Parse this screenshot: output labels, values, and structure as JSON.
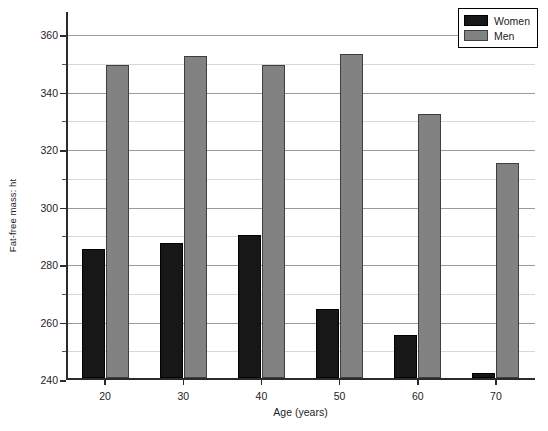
{
  "chart_data": {
    "type": "bar",
    "title": "",
    "xlabel": "Age (years)",
    "ylabel": "Fat-free mass: ht",
    "categories": [
      "20",
      "30",
      "40",
      "50",
      "60",
      "70"
    ],
    "series": [
      {
        "name": "Women",
        "color": "#171717",
        "values": [
          285,
          287,
          290,
          264,
          255,
          242
        ]
      },
      {
        "name": "Men",
        "color": "#828282",
        "values": [
          349,
          352,
          349,
          353,
          332,
          315
        ]
      }
    ],
    "ylim": [
      240,
      368
    ],
    "y_ticks": [
      240,
      260,
      280,
      300,
      320,
      340,
      360
    ],
    "y_minor_ticks": [
      250,
      270,
      290,
      310,
      330,
      350
    ],
    "grid": true,
    "legend_position": "top-right"
  },
  "legend": {
    "entries": [
      {
        "label": "Women",
        "swatch": "women"
      },
      {
        "label": "Men",
        "swatch": "men"
      }
    ]
  }
}
